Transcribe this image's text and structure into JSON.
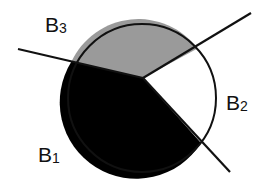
{
  "diagram": {
    "type": "partitioned-circle",
    "circle": {
      "cx": 142,
      "cy": 98,
      "r": 74,
      "stroke": "#111111"
    },
    "junction": {
      "x": 143,
      "y": 78
    },
    "regions": [
      {
        "id": "B1",
        "letter": "B",
        "subscript": "1",
        "fill": "#000000",
        "label_x": 38,
        "label_y": 162
      },
      {
        "id": "B2",
        "letter": "B",
        "subscript": "2",
        "fill": "#ffffff",
        "label_x": 228,
        "label_y": 110
      },
      {
        "id": "B3",
        "letter": "B",
        "subscript": "3",
        "fill": "#9a9a9a",
        "label_x": 45,
        "label_y": 32
      }
    ],
    "lines": [
      {
        "name": "left-boundary-line",
        "x1": 18,
        "y1": 49,
        "x2": 143,
        "y2": 78
      },
      {
        "name": "upper-right-boundary-line",
        "x1": 143,
        "y1": 78,
        "x2": 251,
        "y2": 13
      },
      {
        "name": "lower-right-boundary-line",
        "x1": 143,
        "y1": 78,
        "x2": 230,
        "y2": 172
      }
    ]
  }
}
